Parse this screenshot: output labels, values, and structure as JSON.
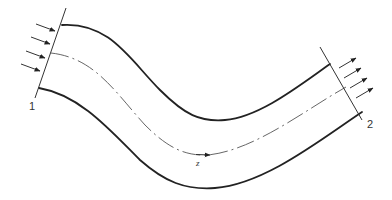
{
  "diagram": {
    "labels": {
      "inlet_section": "1",
      "outlet_section": "2",
      "axial_coordinate": "z"
    },
    "colors": {
      "background": "#ffffff",
      "stroke": "#222222",
      "centerline": "#555555"
    },
    "inlet_arrow_count": 4,
    "outlet_arrow_count": 4
  }
}
